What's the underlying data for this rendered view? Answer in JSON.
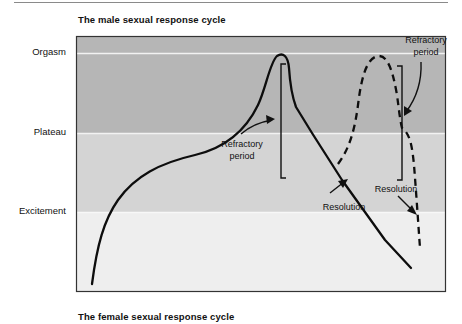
{
  "figure": {
    "top_title": "The male sexual response cycle",
    "bottom_title": "The female sexual response cycle"
  },
  "y_axis": {
    "levels": [
      {
        "label": "Orgasm"
      },
      {
        "label": "Plateau"
      },
      {
        "label": "Excitement"
      }
    ]
  },
  "annotations": {
    "refractory_1": {
      "line1": "Refractory",
      "line2": "period"
    },
    "refractory_2": {
      "line1": "Refractory",
      "line2": "period"
    },
    "resolution_1": "Resolution",
    "resolution_2": "Resolution"
  },
  "legend_series": [
    {
      "name": "First response (solid line)",
      "style": "solid"
    },
    {
      "name": "Second response (dashed line)",
      "style": "dashed"
    }
  ],
  "colors": {
    "orgasm_band": "#b4b4b4",
    "plateau_band": "#d3d3d3",
    "excitement_band": "#efefef",
    "band_divider": "#f4f4f4",
    "curve": "#0d0d0d",
    "frame": "#333333"
  }
}
